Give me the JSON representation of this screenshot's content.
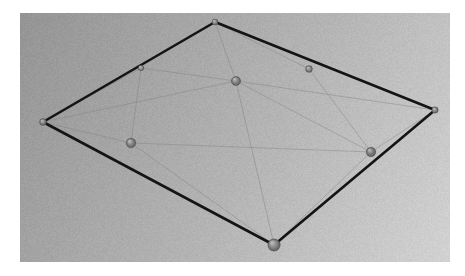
{
  "figure": {
    "canvas": {
      "width": 465,
      "height": 276,
      "background_color": "#ffffff"
    },
    "viewport": {
      "x": 20,
      "y": 13,
      "width": 430,
      "height": 249,
      "gradient_start_color": "#949494",
      "gradient_end_color": "#d2d2d2",
      "gradient_angle_deg": 135,
      "noise": "fine-grain"
    }
  },
  "chart_data": {
    "type": "scatter",
    "xlabel": "",
    "ylabel": "",
    "grid": false,
    "legend": false,
    "xlim": [
      20,
      450
    ],
    "ylim": [
      13,
      262
    ],
    "boundary": {
      "name": "outer-quad",
      "color": "#141414",
      "width": 2.6,
      "closed": true,
      "points": [
        {
          "id": "top",
          "x": 215,
          "y": 22
        },
        {
          "id": "right",
          "x": 435,
          "y": 110
        },
        {
          "id": "bottom",
          "x": 274,
          "y": 245
        },
        {
          "id": "left",
          "x": 43,
          "y": 122
        }
      ]
    },
    "nodes": [
      {
        "id": "n-top",
        "label": "top-corner",
        "x": 215,
        "y": 22,
        "r": 3.0,
        "color": "#8c8c8c",
        "on_boundary": true
      },
      {
        "id": "n-right",
        "label": "right-corner",
        "x": 435,
        "y": 110,
        "r": 3.2,
        "color": "#8a8a8a",
        "on_boundary": true
      },
      {
        "id": "n-bottom",
        "label": "bottom-corner",
        "x": 274,
        "y": 245,
        "r": 6.2,
        "color": "#8b8b8b",
        "on_boundary": true
      },
      {
        "id": "n-left",
        "label": "left-corner",
        "x": 43,
        "y": 122,
        "r": 3.4,
        "color": "#8a8a8a",
        "on_boundary": true
      },
      {
        "id": "n-edge-upleft",
        "label": "upper-left-edge",
        "x": 141,
        "y": 68,
        "r": 2.8,
        "color": "#949494",
        "on_boundary": true
      },
      {
        "id": "n-center",
        "label": "center",
        "x": 236,
        "y": 81,
        "r": 4.6,
        "color": "#868686",
        "on_boundary": false
      },
      {
        "id": "n-upright",
        "label": "upper-right-inner",
        "x": 309,
        "y": 69,
        "r": 3.4,
        "color": "#8d8d8d",
        "on_boundary": false
      },
      {
        "id": "n-lowleft",
        "label": "lower-left-inner",
        "x": 131,
        "y": 143,
        "r": 4.8,
        "color": "#888888",
        "on_boundary": false
      },
      {
        "id": "n-lowright",
        "label": "lower-right-inner",
        "x": 371,
        "y": 152,
        "r": 4.8,
        "color": "#7f7f7f",
        "on_boundary": false
      }
    ],
    "edges": [
      {
        "from": "n-edge-upleft",
        "to": "n-center",
        "color": "#7e7e7e",
        "width": 0.8
      },
      {
        "from": "n-edge-upleft",
        "to": "n-lowleft",
        "color": "#7e7e7e",
        "width": 0.8
      },
      {
        "from": "n-center",
        "to": "n-top",
        "color": "#7e7e7e",
        "width": 0.8
      },
      {
        "from": "n-center",
        "to": "n-bottom",
        "color": "#7e7e7e",
        "width": 0.8
      },
      {
        "from": "n-center",
        "to": "n-left",
        "color": "#7e7e7e",
        "width": 0.8
      },
      {
        "from": "n-center",
        "to": "n-lowright",
        "color": "#7e7e7e",
        "width": 0.8
      },
      {
        "from": "n-center",
        "to": "n-right",
        "color": "#7e7e7e",
        "width": 0.8
      },
      {
        "from": "n-upright",
        "to": "n-lowright",
        "color": "#7e7e7e",
        "width": 0.8
      },
      {
        "from": "n-upright",
        "to": "n-top",
        "color": "#7e7e7e",
        "width": 0.8
      },
      {
        "from": "n-lowleft",
        "to": "n-left",
        "color": "#7e7e7e",
        "width": 0.8
      },
      {
        "from": "n-lowleft",
        "to": "n-bottom",
        "color": "#7e7e7e",
        "width": 0.8
      },
      {
        "from": "n-lowleft",
        "to": "n-lowright",
        "color": "#7e7e7e",
        "width": 0.8
      },
      {
        "from": "n-lowright",
        "to": "n-bottom",
        "color": "#7e7e7e",
        "width": 0.8
      },
      {
        "from": "n-lowright",
        "to": "n-right",
        "color": "#7e7e7e",
        "width": 0.8
      },
      {
        "from": "n-left",
        "to": "n-edge-upleft",
        "color": "#7e7e7e",
        "width": 0.8
      }
    ]
  }
}
